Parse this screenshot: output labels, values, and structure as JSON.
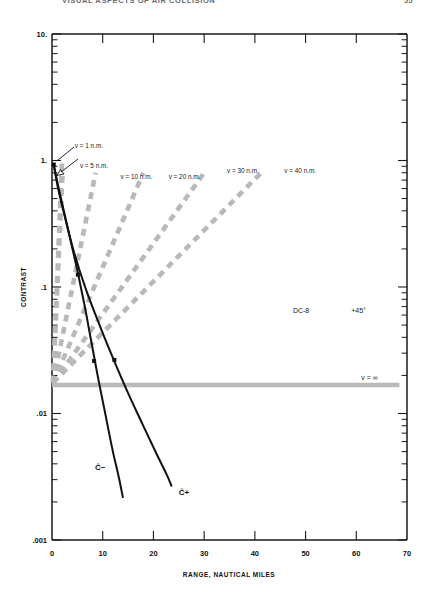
{
  "running_head": {
    "title": "VISUAL ASPECTS OF AIR COLLISION",
    "page_number": "55"
  },
  "chart_data": {
    "type": "line",
    "title": "",
    "xlabel": "RANGE, NAUTICAL MILES",
    "ylabel": "CONTRAST",
    "xlim": [
      0,
      70
    ],
    "ylim": [
      0.001,
      10
    ],
    "yscale": "log",
    "xscale": "linear",
    "grid": false,
    "legend": "none",
    "xticks": [
      0,
      10,
      20,
      30,
      40,
      50,
      60,
      70
    ],
    "xtick_labels": [
      "0",
      "10",
      "20",
      "30",
      "40",
      "50",
      "60",
      "70"
    ],
    "yticks": [
      10,
      1,
      0.1,
      0.01,
      0.001
    ],
    "ytick_labels": [
      "10.",
      "1.",
      ".1",
      ".01",
      ".001"
    ],
    "annotations": [
      {
        "name": "aircraft-type",
        "text": "DC-8",
        "x": 47.5,
        "y": 0.062
      },
      {
        "name": "aspect-angle",
        "text": "+45°",
        "x": 59.0,
        "y": 0.062
      },
      {
        "name": "c-minus-label",
        "text": "Ĉ−",
        "x": 8.5,
        "y": 0.0036
      },
      {
        "name": "c-plus-label",
        "text": "Ĉ+",
        "x": 25.0,
        "y": 0.00225
      }
    ],
    "series": [
      {
        "name": "v = 1 n.m.",
        "style": "dashed-gray",
        "label": "v = 1 n.m.",
        "label_x": 4.5,
        "label_y": 1.25,
        "points": [
          [
            0.2,
            0.0175
          ],
          [
            2.0,
            1.05
          ]
        ]
      },
      {
        "name": "v = 5 n.m.",
        "style": "dashed-gray",
        "label": "v = 5 n.m.",
        "label_x": 5.5,
        "label_y": 0.88,
        "points": [
          [
            0.2,
            0.0175
          ],
          [
            2.1,
            0.8
          ]
        ]
      },
      {
        "name": "v = 10 n.m.",
        "style": "dashed-gray",
        "label": "v = 10 n.m.",
        "label_x": 13.5,
        "label_y": 0.72,
        "points": [
          [
            0.2,
            0.0175
          ],
          [
            8.6,
            0.8
          ]
        ]
      },
      {
        "name": "v = 20 n.m.",
        "style": "dashed-gray",
        "label": "v = 20 n.m.",
        "label_x": 23.0,
        "label_y": 0.72,
        "points": [
          [
            0.2,
            0.0175
          ],
          [
            18.0,
            0.8
          ]
        ]
      },
      {
        "name": "v = 30 n.m.",
        "style": "dashed-gray",
        "label": "v = 30 n.m.",
        "label_x": 34.5,
        "label_y": 0.8,
        "points": [
          [
            0.2,
            0.0175
          ],
          [
            30.2,
            0.82
          ]
        ]
      },
      {
        "name": "v = 40 n.m.",
        "style": "dashed-gray",
        "label": "v = 40 n.m.",
        "label_x": 45.8,
        "label_y": 0.8,
        "points": [
          [
            0.2,
            0.0175
          ],
          [
            41.5,
            0.82
          ]
        ]
      },
      {
        "name": "v = infinity",
        "style": "solid-gray",
        "label": "v = ∞",
        "label_x": 61.0,
        "label_y": 0.0185,
        "points": [
          [
            0.0,
            0.0168
          ],
          [
            68.5,
            0.0168
          ]
        ]
      },
      {
        "name": "C-hat-minus",
        "style": "solid-black",
        "label": "Ĉ−",
        "points": [
          [
            0.3,
            0.95
          ],
          [
            0.9,
            0.72
          ],
          [
            2.0,
            0.46
          ],
          [
            3.4,
            0.26
          ],
          [
            5.0,
            0.135
          ],
          [
            6.4,
            0.072
          ],
          [
            7.6,
            0.04
          ],
          [
            9.0,
            0.02
          ],
          [
            10.6,
            0.0095
          ],
          [
            12.0,
            0.005
          ],
          [
            13.2,
            0.0031
          ],
          [
            14.0,
            0.00215
          ]
        ]
      },
      {
        "name": "C-hat-plus",
        "style": "solid-black",
        "label": "Ĉ+",
        "points": [
          [
            0.3,
            0.95
          ],
          [
            1.2,
            0.6
          ],
          [
            2.6,
            0.35
          ],
          [
            4.4,
            0.185
          ],
          [
            6.6,
            0.098
          ],
          [
            9.2,
            0.052
          ],
          [
            12.0,
            0.0275
          ],
          [
            15.0,
            0.0145
          ],
          [
            18.0,
            0.008
          ],
          [
            20.6,
            0.0048
          ],
          [
            22.6,
            0.0033
          ],
          [
            23.6,
            0.00265
          ]
        ]
      }
    ],
    "markers": [
      {
        "name": "origin-marker",
        "x": 0.35,
        "y": 0.93
      },
      {
        "name": "c-minus-marker-1",
        "x": 5.1,
        "y": 0.125
      },
      {
        "name": "c-minus-marker-2",
        "x": 8.3,
        "y": 0.026
      },
      {
        "name": "c-plus-marker-1",
        "x": 12.3,
        "y": 0.0265
      }
    ],
    "colors": {
      "curve": "#111111",
      "fan": "#b9b9b9",
      "axis": "#1a1a1a",
      "background": "#ffffff"
    }
  }
}
